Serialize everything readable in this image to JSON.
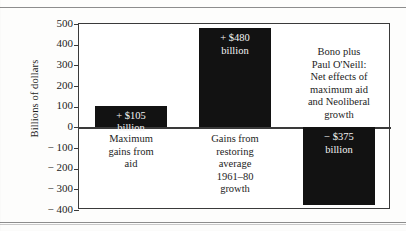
{
  "chart_data": {
    "type": "bar",
    "title": "",
    "xlabel": "",
    "ylabel": "Billions of dollars",
    "ylim": [
      -400,
      500
    ],
    "ytick_labels": [
      "500",
      "400",
      "300",
      "200",
      "100",
      "0",
      "− 100",
      "− 200",
      "− 300",
      "− 400"
    ],
    "ytick_values": [
      500,
      400,
      300,
      200,
      100,
      0,
      -100,
      -200,
      -300,
      -400
    ],
    "grid": false,
    "legend": null,
    "categories": [
      "Maximum gains from aid",
      "Gains from restoring average 1961–80 growth",
      "Bono plus Paul O'Neill: Net effects of maximum aid and Neoliberal growth"
    ],
    "values": [
      105,
      480,
      -375
    ],
    "data_labels": [
      "+ $105 billion",
      "+ $480 billion",
      "− $375 billion"
    ],
    "bar_color": "#121212",
    "axis_color": "#3a3a3a",
    "bars": [
      {
        "name": "maximum-gains-from-aid",
        "value": 105,
        "value_line1": "+ $105",
        "value_line2": "billion",
        "caption_lines": [
          "Maximum",
          "gains from",
          "aid"
        ]
      },
      {
        "name": "gains-from-restoring-average-growth",
        "value": 480,
        "value_line1": "+ $480",
        "value_line2": "billion",
        "caption_lines": [
          "Gains from",
          "restoring",
          "average",
          "1961–80",
          "growth"
        ]
      },
      {
        "name": "bono-plus-paul-oneill-net-effects",
        "value": -375,
        "value_line1": "− $375",
        "value_line2": "billion",
        "caption_lines": [
          "Bono plus",
          "Paul O'Neill:",
          "Net effects of",
          "maximum aid",
          "and Neoliberal",
          "growth"
        ]
      }
    ]
  }
}
